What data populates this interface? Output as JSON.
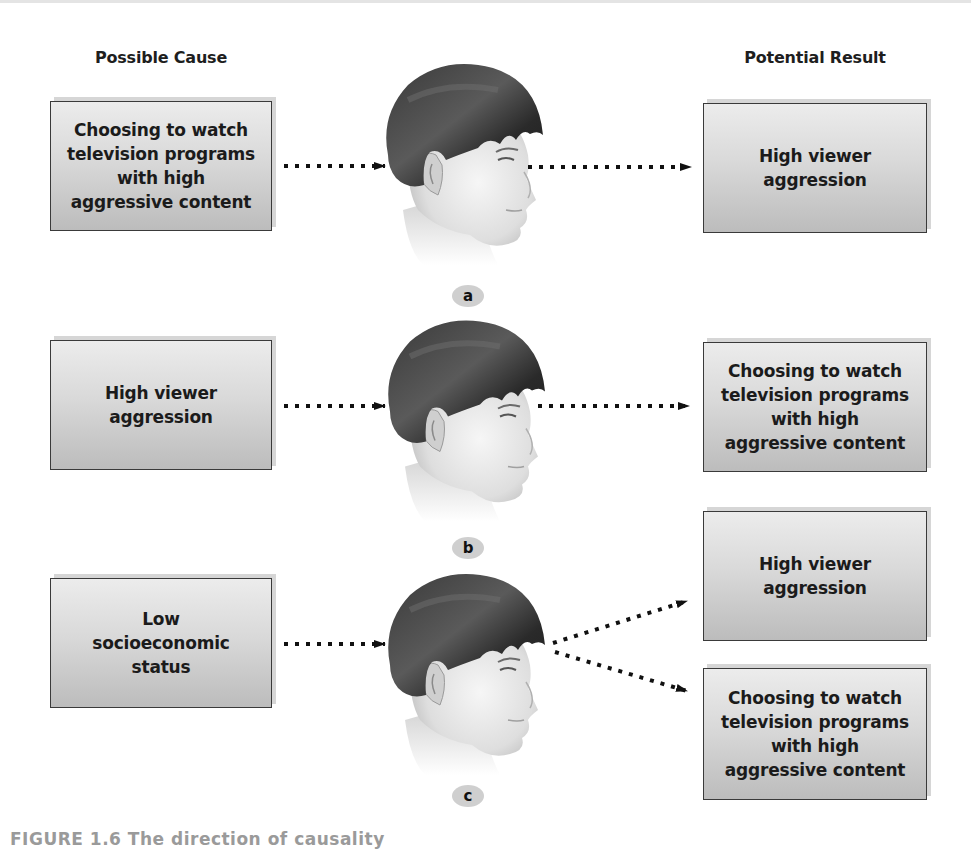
{
  "headers": {
    "cause": "Possible Cause",
    "result": "Potential Result"
  },
  "rows": [
    {
      "label": "a",
      "cause": "Choosing to watch\ntelevision programs\nwith high\naggressive content",
      "results": [
        "High viewer\naggression"
      ]
    },
    {
      "label": "b",
      "cause": "High viewer\naggression",
      "results": [
        "Choosing to watch\ntelevision programs\nwith high\naggressive content"
      ]
    },
    {
      "label": "c",
      "cause": "Low\nsocioeconomic\nstatus",
      "results": [
        "High viewer\naggression",
        "Choosing to watch\ntelevision programs\nwith high\naggressive content"
      ]
    }
  ],
  "caption": "FIGURE 1.6 The direction of causality",
  "icons": {
    "head": "child-head-profile-icon",
    "arrow": "dotted-arrow"
  },
  "colors": {
    "box_top": "#ececec",
    "box_bottom": "#bcbcbc",
    "box_border": "#3a3a3a",
    "badge": "#cfcfcf",
    "hair": "#2b2b2b"
  }
}
